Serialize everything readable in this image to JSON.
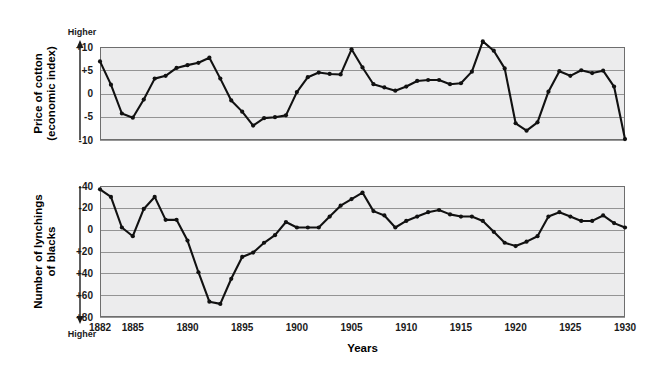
{
  "figure": {
    "xlabel": "Years",
    "background_color": "#ffffff",
    "plot_background_color": "#ececed",
    "line_color": "#111111",
    "grid_color": "#8a8a8a",
    "frame_color": "#6e6e6e"
  },
  "chart_data": [
    {
      "type": "line",
      "title": "",
      "ylabel": "Price of cotton (economic index)",
      "ylabel_lines": [
        "Price of cotton",
        "(economic index)"
      ],
      "xlabel": "Years",
      "direction_label": "Higher",
      "direction": "up",
      "grid": true,
      "legend": "none",
      "ylim": [
        -10,
        10
      ],
      "yticks": [
        10,
        5,
        0,
        -5,
        -10
      ],
      "ytick_labels": [
        "+10",
        "+5",
        "0",
        "-5",
        "-10"
      ],
      "xlim": [
        1882,
        1930
      ],
      "xticks": [
        1882,
        1885,
        1890,
        1895,
        1900,
        1905,
        1910,
        1915,
        1920,
        1925,
        1930
      ],
      "xtick_labels": [
        "1882",
        "1885",
        "1890",
        "1895",
        "1900",
        "1905",
        "1910",
        "1915",
        "1920",
        "1925",
        "1930"
      ],
      "x": [
        1882,
        1883,
        1884,
        1885,
        1886,
        1887,
        1888,
        1889,
        1890,
        1891,
        1892,
        1893,
        1894,
        1895,
        1896,
        1897,
        1898,
        1899,
        1900,
        1901,
        1902,
        1903,
        1904,
        1905,
        1906,
        1907,
        1908,
        1909,
        1910,
        1911,
        1912,
        1913,
        1914,
        1915,
        1916,
        1917,
        1918,
        1919,
        1920,
        1921,
        1922,
        1923,
        1924,
        1925,
        1926,
        1927,
        1928,
        1929,
        1930
      ],
      "values": [
        6.9,
        1.9,
        -4.3,
        -4.6,
        -5.2,
        -1.3,
        0.6,
        3.2,
        3.5,
        4.4,
        5.5,
        6.1,
        6.6,
        7.7,
        3.2,
        -1.5,
        -3.9,
        -6.0,
        -7.0,
        -5.3,
        -5.1,
        -4.7,
        0.3,
        3.5,
        4.5,
        4.2,
        3.4,
        1.5,
        0.1,
        -0.6,
        -1.7,
        -2.2,
        -1.1,
        -0.9,
        0.3,
        0.5,
        -0.4,
        2.2,
        5.3,
        7.8,
        6.5,
        3.3,
        -4.9,
        -6.5,
        -5.0,
        3.4,
        4.5,
        4.4,
        4.6,
        4.6,
        1.8,
        -9.8
      ],
      "series": [
        {
          "name": "Price of cotton (economic index)",
          "points": [
            {
              "year": 1882,
              "value": 6.9
            },
            {
              "year": 1883,
              "value": 1.9
            },
            {
              "year": 1884,
              "value": -4.3
            },
            {
              "year": 1885,
              "value": -5.2
            },
            {
              "year": 1886,
              "value": -1.3
            },
            {
              "year": 1887,
              "value": 3.2
            },
            {
              "year": 1888,
              "value": 3.8
            },
            {
              "year": 1889,
              "value": 5.5
            },
            {
              "year": 1890,
              "value": 6.1
            },
            {
              "year": 1891,
              "value": 6.6
            },
            {
              "year": 1892,
              "value": 7.7
            },
            {
              "year": 1893,
              "value": 3.2
            },
            {
              "year": 1894,
              "value": -1.5
            },
            {
              "year": 1895,
              "value": -3.9
            },
            {
              "year": 1896,
              "value": -6.9
            },
            {
              "year": 1897,
              "value": -5.3
            },
            {
              "year": 1898,
              "value": -5.1
            },
            {
              "year": 1899,
              "value": -4.7
            },
            {
              "year": 1900,
              "value": 0.3
            },
            {
              "year": 1901,
              "value": 3.5
            },
            {
              "year": 1902,
              "value": 4.5
            },
            {
              "year": 1903,
              "value": 4.2
            },
            {
              "year": 1904,
              "value": 4.1
            },
            {
              "year": 1905,
              "value": 9.5
            },
            {
              "year": 1906,
              "value": 5.6
            },
            {
              "year": 1907,
              "value": 2.0
            },
            {
              "year": 1908,
              "value": 1.3
            },
            {
              "year": 1909,
              "value": 0.6
            },
            {
              "year": 1910,
              "value": 1.5
            },
            {
              "year": 1911,
              "value": 2.7
            },
            {
              "year": 1912,
              "value": 2.9
            },
            {
              "year": 1913,
              "value": 2.9
            },
            {
              "year": 1914,
              "value": 2.0
            },
            {
              "year": 1915,
              "value": 2.2
            },
            {
              "year": 1916,
              "value": 4.7
            },
            {
              "year": 1917,
              "value": 11.2
            },
            {
              "year": 1918,
              "value": 9.2
            },
            {
              "year": 1919,
              "value": 5.4
            },
            {
              "year": 1920,
              "value": -6.4
            },
            {
              "year": 1921,
              "value": -8.0
            },
            {
              "year": 1922,
              "value": -6.2
            },
            {
              "year": 1923,
              "value": 0.4
            },
            {
              "year": 1924,
              "value": 4.8
            },
            {
              "year": 1925,
              "value": 3.8
            },
            {
              "year": 1926,
              "value": 5.0
            },
            {
              "year": 1927,
              "value": 4.4
            },
            {
              "year": 1928,
              "value": 4.9
            },
            {
              "year": 1929,
              "value": 1.5
            },
            {
              "year": 1930,
              "value": -9.8
            }
          ]
        }
      ]
    },
    {
      "type": "line",
      "title": "",
      "ylabel": "Number of lynchings of blacks",
      "ylabel_lines": [
        "Number of lynchings",
        "of blacks"
      ],
      "xlabel": "Years",
      "direction_label": "Higher",
      "direction": "down",
      "axis_inverted": true,
      "grid": true,
      "legend": "none",
      "ylim": [
        -40,
        80
      ],
      "yticks": [
        -40,
        -20,
        0,
        20,
        40,
        60,
        80
      ],
      "ytick_labels": [
        "-40",
        "-20",
        "0",
        "+20",
        "+40",
        "+60",
        "+80"
      ],
      "xlim": [
        1882,
        1930
      ],
      "xticks": [
        1882,
        1885,
        1890,
        1895,
        1900,
        1905,
        1910,
        1915,
        1920,
        1925,
        1930
      ],
      "xtick_labels": [
        "1882",
        "1885",
        "1890",
        "1895",
        "1900",
        "1905",
        "1910",
        "1915",
        "1920",
        "1925",
        "1930"
      ],
      "series": [
        {
          "name": "Number of lynchings of blacks",
          "points": [
            {
              "year": 1882,
              "value": -37
            },
            {
              "year": 1883,
              "value": -30
            },
            {
              "year": 1884,
              "value": -2
            },
            {
              "year": 1885,
              "value": 6
            },
            {
              "year": 1886,
              "value": -19
            },
            {
              "year": 1887,
              "value": -30
            },
            {
              "year": 1888,
              "value": -9
            },
            {
              "year": 1889,
              "value": -9
            },
            {
              "year": 1890,
              "value": 10
            },
            {
              "year": 1891,
              "value": 39
            },
            {
              "year": 1892,
              "value": 66
            },
            {
              "year": 1893,
              "value": 68
            },
            {
              "year": 1894,
              "value": 45
            },
            {
              "year": 1895,
              "value": 25
            },
            {
              "year": 1896,
              "value": 21
            },
            {
              "year": 1897,
              "value": 12
            },
            {
              "year": 1898,
              "value": 5
            },
            {
              "year": 1899,
              "value": -7
            },
            {
              "year": 1900,
              "value": -2
            },
            {
              "year": 1901,
              "value": -2
            },
            {
              "year": 1902,
              "value": -2
            },
            {
              "year": 1903,
              "value": -12
            },
            {
              "year": 1904,
              "value": -22
            },
            {
              "year": 1905,
              "value": -28
            },
            {
              "year": 1906,
              "value": -34
            },
            {
              "year": 1907,
              "value": -17
            },
            {
              "year": 1908,
              "value": -13
            },
            {
              "year": 1909,
              "value": -2
            },
            {
              "year": 1910,
              "value": -8
            },
            {
              "year": 1911,
              "value": -12
            },
            {
              "year": 1912,
              "value": -16
            },
            {
              "year": 1913,
              "value": -18
            },
            {
              "year": 1914,
              "value": -14
            },
            {
              "year": 1915,
              "value": -12
            },
            {
              "year": 1916,
              "value": -12
            },
            {
              "year": 1917,
              "value": -8
            },
            {
              "year": 1918,
              "value": 2
            },
            {
              "year": 1919,
              "value": 12
            },
            {
              "year": 1920,
              "value": 15
            },
            {
              "year": 1921,
              "value": 11
            },
            {
              "year": 1922,
              "value": 6
            },
            {
              "year": 1923,
              "value": -12
            },
            {
              "year": 1924,
              "value": -16
            },
            {
              "year": 1925,
              "value": -12
            },
            {
              "year": 1926,
              "value": -8
            },
            {
              "year": 1927,
              "value": -8
            },
            {
              "year": 1928,
              "value": -13
            },
            {
              "year": 1929,
              "value": -6
            },
            {
              "year": 1930,
              "value": -2
            }
          ]
        }
      ]
    }
  ]
}
